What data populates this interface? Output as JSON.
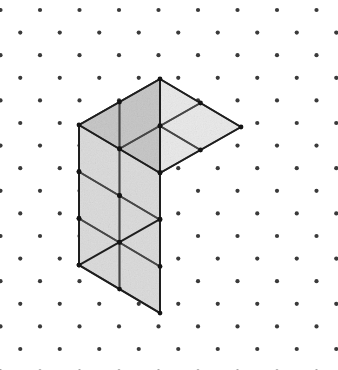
{
  "canvas": {
    "width": 338,
    "height": 370,
    "background_color": "#ffffff",
    "title": "Isometric dot-grid drawing of a stacked cube solid"
  },
  "dot_grid": {
    "name": "isometric-dot-lattice",
    "dot_color": "#3a3a3a",
    "dot_radius": 2.1,
    "column_pitch_x": 39.5,
    "row_pitch_y": 22.6,
    "origin_x": 0.5,
    "origin_y": 10.0,
    "stagger": "triangular",
    "columns": 10,
    "rows": 17
  },
  "figure": {
    "name": "isometric-cube-stack",
    "type": "rectangular-box-of-unit-cubes",
    "dimensions": {
      "width_units": 2,
      "depth_units": 2,
      "height_units": 3,
      "total_cubes": 12
    },
    "apex_top": {
      "x": 160.0,
      "y": 79.0
    },
    "unit_vector_left": {
      "dx": -40.5,
      "dy": 23.0
    },
    "unit_vector_right": {
      "dx": 40.5,
      "dy": 24.0
    },
    "unit_vector_down": {
      "dx": 0.0,
      "dy": 46.7
    },
    "vertices": {
      "top_apex": {
        "x": 160,
        "y": 79
      },
      "top_back_left": {
        "x": 79,
        "y": 125
      },
      "top_back_right": {
        "x": 281,
        "y": 152
      },
      "top_front_center": {
        "x": 200,
        "y": 197
      },
      "bottom_left": {
        "x": 79,
        "y": 265
      },
      "bottom_right": {
        "x": 281,
        "y": 292
      },
      "bottom_front_center": {
        "x": 200,
        "y": 337
      }
    },
    "faces": {
      "top": {
        "label": "top-face",
        "fill": "#e9e9e9",
        "grid_cols": 2,
        "grid_rows": 2,
        "tile_count": 4
      },
      "left": {
        "label": "left-face",
        "fill": "#c4c4c4",
        "grid_cols": 2,
        "grid_rows": 3,
        "tile_count": 6
      },
      "right": {
        "label": "right-face",
        "fill": "#dadada",
        "grid_cols": 2,
        "grid_rows": 3,
        "tile_count": 6
      }
    },
    "edges": {
      "outline_color": "#1e1e1e",
      "outline_width": 2.0,
      "interior_color": "#474747",
      "interior_width": 1.7,
      "vertex_dot_color": "#141414",
      "vertex_dot_radius": 2.4
    },
    "texture": {
      "style": "speckled-noise",
      "opacity": 0.22
    }
  }
}
